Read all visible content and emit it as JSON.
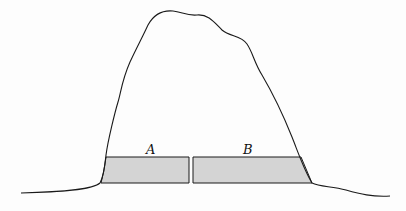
{
  "diagram": {
    "regions": [
      {
        "label": "A",
        "fill": "#d4d4d4"
      },
      {
        "label": "B",
        "fill": "#d4d4d4"
      }
    ],
    "colors": {
      "outline": "#1a1a1a",
      "shading": "#d4d4d4",
      "background": "#fdfdfd"
    }
  }
}
